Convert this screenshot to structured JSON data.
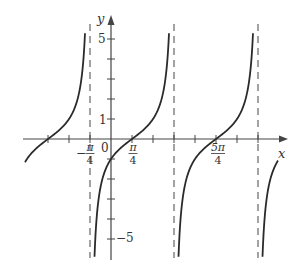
{
  "chart_data": {
    "type": "line",
    "function": "y = tan(x - pi/4)",
    "title": "",
    "xlabel": "x",
    "ylabel": "y",
    "x_tick_labels": [
      {
        "label_num": "π",
        "label_den": "4",
        "sign": "−",
        "value": "-pi/4"
      },
      {
        "label": "0",
        "value": "0"
      },
      {
        "label_num": "π",
        "label_den": "4",
        "sign": "",
        "value": "pi/4"
      },
      {
        "label_num": "5π",
        "label_den": "4",
        "sign": "",
        "value": "5pi/4"
      }
    ],
    "y_tick_labels": [
      {
        "label": "5",
        "value": 5
      },
      {
        "label": "1",
        "value": 1
      },
      {
        "label": "−5",
        "value": -5
      }
    ],
    "x_tick_step": "pi/4",
    "y_tick_step": 1,
    "xlim": [
      "-17pi/16",
      "13pi/8"
    ],
    "ylim": [
      -6,
      6
    ],
    "asymptotes": [
      "-pi/4",
      "3pi/4",
      "7pi/4"
    ],
    "zeros": [
      "-3pi/4",
      "pi/4",
      "5pi/4"
    ],
    "grid": false,
    "legend": null,
    "series": [
      {
        "name": "tan(x - pi/4)",
        "style": "solid",
        "color": "#2b2b2b"
      }
    ]
  },
  "colors": {
    "curve": "#2b2b2b",
    "axis": "#444444",
    "asymptote": "#666666",
    "text": "#333333"
  }
}
